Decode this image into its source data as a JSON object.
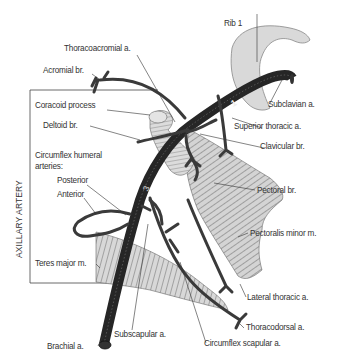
{
  "diagram": {
    "title_vertical": "AXILLARY ARTERY",
    "segment_numbers": [
      "1",
      "2",
      "3"
    ],
    "labels": {
      "rib1": "Rib 1",
      "thoracoacromial": "Thoracoacromial a.",
      "acromial": "Acromial br.",
      "coracoid": "Coracoid process",
      "subclavian": "Subclavian a.",
      "deltoid": "Deltoid br.",
      "superior_thoracic": "Superior thoracic a.",
      "clavicular": "Clavicular br.",
      "circumflex_humeral_1": "Circumflex humeral",
      "circumflex_humeral_2": "arteries:",
      "posterior": "Posterior",
      "anterior": "Anterior",
      "pectoral": "Pectoral br.",
      "pectoralis_minor": "Pectoralis minor m.",
      "teres_major": "Teres major m.",
      "lateral_thoracic": "Lateral thoracic a.",
      "thoracodorsal": "Thoracodorsal a.",
      "brachial": "Brachial a.",
      "subscapular": "Subscapular a.",
      "circumflex_scapular": "Circumflex scapular a."
    },
    "colors": {
      "artery": "#2a2a2a",
      "bone": "#d9d9d9",
      "muscle": "#c8c8c8",
      "line": "#333333"
    }
  }
}
